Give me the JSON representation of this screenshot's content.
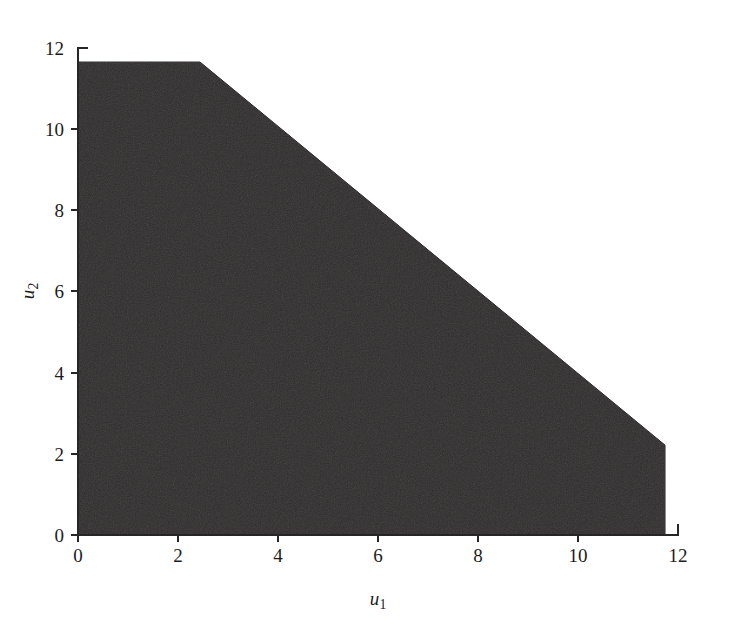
{
  "figure": {
    "background_color": "#ffffff",
    "axis_color": "#262626"
  },
  "chart_data": {
    "type": "area",
    "title": "",
    "subtitle": "",
    "xlabel": "u",
    "xlabel_sub": "1",
    "ylabel": "u",
    "ylabel_sub": "2",
    "xlim": [
      0,
      12
    ],
    "ylim": [
      0,
      12
    ],
    "xticks": [
      0,
      2,
      4,
      6,
      8,
      10,
      12
    ],
    "yticks": [
      0,
      2,
      4,
      6,
      8,
      10,
      12
    ],
    "xtick_labels": [
      "0",
      "2",
      "4",
      "6",
      "8",
      "10",
      "12"
    ],
    "ytick_labels": [
      "0",
      "2",
      "4",
      "6",
      "8",
      "10",
      "12"
    ],
    "grid": false,
    "legend": false,
    "legend_position": "none",
    "annotations": [],
    "series": [
      {
        "name": "feasible region",
        "kind": "filled-polygon",
        "fill_color": "#231f20",
        "edge_color": "#231f20",
        "polygon": [
          {
            "u1": 0.0,
            "u2": 0.0
          },
          {
            "u1": 0.0,
            "u2": 11.63
          },
          {
            "u1": 2.44,
            "u2": 11.63
          },
          {
            "u1": 11.74,
            "u2": 2.21
          },
          {
            "u1": 11.74,
            "u2": 0.0
          }
        ],
        "boundary_description": {
          "top_flat_level": 11.63,
          "right_vertical_level": 11.74,
          "diagonal_from": {
            "u1": 2.44,
            "u2": 11.63
          },
          "diagonal_to": {
            "u1": 11.74,
            "u2": 2.21
          },
          "diagonal_slope": -1.01
        }
      }
    ]
  }
}
